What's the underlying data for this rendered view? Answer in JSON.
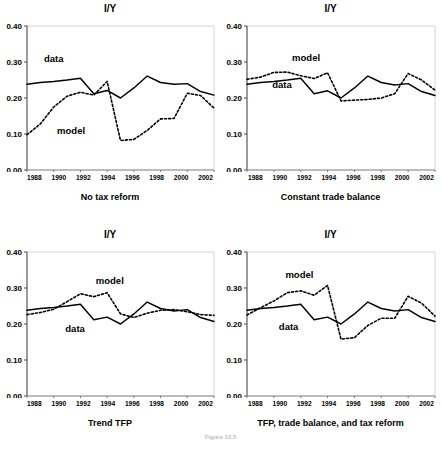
{
  "figure": {
    "caption": "Figure 12.5",
    "panel_count": 4
  },
  "chart_data": [
    {
      "id": "no-tax-reform",
      "type": "line",
      "title": "I/Y",
      "xlabel": "No tax reform",
      "ylabel": "",
      "ylim": [
        0.0,
        0.4
      ],
      "xlim": [
        1988,
        2002
      ],
      "yticks": [
        "0.00",
        "0.10",
        "0.20",
        "0.30",
        "0.40"
      ],
      "ytick_values": [
        0.0,
        0.1,
        0.2,
        0.3,
        0.4
      ],
      "xticks": [
        "1988",
        "1990",
        "1992",
        "1994",
        "1996",
        "1998",
        "2000",
        "2002"
      ],
      "xtick_values": [
        1988,
        1990,
        1992,
        1994,
        1996,
        1998,
        2000,
        2002
      ],
      "grid": false,
      "legend": "inline-annotation",
      "annotations": [
        {
          "text": "data",
          "x": 1990.0,
          "y": 0.3
        },
        {
          "text": "model",
          "x": 1991.3,
          "y": 0.1
        }
      ],
      "x": [
        1988,
        1989,
        1990,
        1991,
        1992,
        1993,
        1994,
        1995,
        1996,
        1997,
        1998,
        1999,
        2000,
        2001,
        2002
      ],
      "series": [
        {
          "name": "data",
          "style": "solid",
          "values": [
            0.238,
            0.243,
            0.246,
            0.25,
            0.255,
            0.212,
            0.221,
            0.2,
            0.228,
            0.261,
            0.243,
            0.238,
            0.24,
            0.218,
            0.208
          ]
        },
        {
          "name": "model",
          "style": "dashed",
          "values": [
            0.098,
            0.128,
            0.175,
            0.205,
            0.216,
            0.208,
            0.246,
            0.082,
            0.085,
            0.11,
            0.142,
            0.143,
            0.213,
            0.207,
            0.172
          ]
        }
      ]
    },
    {
      "id": "constant-trade-balance",
      "type": "line",
      "title": "I/Y",
      "xlabel": "Constant trade balance",
      "ylabel": "",
      "ylim": [
        0.0,
        0.4
      ],
      "xlim": [
        1988,
        2002
      ],
      "yticks": [
        "0.00",
        "0.10",
        "0.20",
        "0.30",
        "0.40"
      ],
      "ytick_values": [
        0.0,
        0.1,
        0.2,
        0.3,
        0.4
      ],
      "xticks": [
        "1988",
        "1990",
        "1992",
        "1994",
        "1996",
        "1998",
        "2000",
        "2002"
      ],
      "xtick_values": [
        1988,
        1990,
        1992,
        1994,
        1996,
        1998,
        2000,
        2002
      ],
      "grid": false,
      "legend": "inline-annotation",
      "annotations": [
        {
          "text": "model",
          "x": 1992.4,
          "y": 0.303
        },
        {
          "text": "data",
          "x": 1990.6,
          "y": 0.228
        }
      ],
      "x": [
        1988,
        1989,
        1990,
        1991,
        1992,
        1993,
        1994,
        1995,
        1996,
        1997,
        1998,
        1999,
        2000,
        2001,
        2002
      ],
      "series": [
        {
          "name": "data",
          "style": "solid",
          "values": [
            0.238,
            0.243,
            0.246,
            0.25,
            0.255,
            0.212,
            0.22,
            0.2,
            0.228,
            0.261,
            0.243,
            0.236,
            0.24,
            0.218,
            0.207
          ]
        },
        {
          "name": "model",
          "style": "dashed",
          "values": [
            0.252,
            0.258,
            0.271,
            0.272,
            0.262,
            0.254,
            0.27,
            0.192,
            0.194,
            0.196,
            0.2,
            0.212,
            0.268,
            0.25,
            0.222
          ]
        }
      ]
    },
    {
      "id": "trend-tfp",
      "type": "line",
      "title": "I/Y",
      "xlabel": "Trend TFP",
      "ylabel": "",
      "ylim": [
        0.0,
        0.4
      ],
      "xlim": [
        1988,
        2002
      ],
      "yticks": [
        "0.00",
        "0.10",
        "0.20",
        "0.30",
        "0.40"
      ],
      "ytick_values": [
        0.0,
        0.1,
        0.2,
        0.3,
        0.4
      ],
      "xticks": [
        "1988",
        "1990",
        "1992",
        "1994",
        "1996",
        "1998",
        "2000",
        "2002"
      ],
      "xtick_values": [
        1988,
        1990,
        1992,
        1994,
        1996,
        1998,
        2000,
        2002
      ],
      "grid": false,
      "legend": "inline-annotation",
      "annotations": [
        {
          "text": "model",
          "x": 1994.2,
          "y": 0.31
        },
        {
          "text": "data",
          "x": 1991.6,
          "y": 0.178
        }
      ],
      "x": [
        1988,
        1989,
        1990,
        1991,
        1992,
        1993,
        1994,
        1995,
        1996,
        1997,
        1998,
        1999,
        2000,
        2001,
        2002
      ],
      "series": [
        {
          "name": "data",
          "style": "solid",
          "values": [
            0.238,
            0.243,
            0.246,
            0.25,
            0.255,
            0.212,
            0.219,
            0.2,
            0.228,
            0.261,
            0.243,
            0.236,
            0.24,
            0.218,
            0.207
          ]
        },
        {
          "name": "model",
          "style": "dashed",
          "values": [
            0.226,
            0.232,
            0.241,
            0.262,
            0.284,
            0.276,
            0.287,
            0.228,
            0.218,
            0.23,
            0.238,
            0.24,
            0.234,
            0.226,
            0.224
          ]
        }
      ]
    },
    {
      "id": "tfp-trade-balance-tax-reform",
      "type": "line",
      "title": "I/Y",
      "xlabel": "TFP, trade balance, and tax reform",
      "ylabel": "",
      "ylim": [
        0.0,
        0.4
      ],
      "xlim": [
        1988,
        2002
      ],
      "yticks": [
        "0.00",
        "0.10",
        "0.20",
        "0.30",
        "0.40"
      ],
      "ytick_values": [
        0.0,
        0.1,
        0.2,
        0.3,
        0.4
      ],
      "xticks": [
        "1988",
        "1990",
        "1992",
        "1994",
        "1996",
        "1998",
        "2000",
        "2002"
      ],
      "xtick_values": [
        1988,
        1990,
        1992,
        1994,
        1996,
        1998,
        2000,
        2002
      ],
      "grid": false,
      "legend": "inline-annotation",
      "annotations": [
        {
          "text": "model",
          "x": 1991.9,
          "y": 0.327
        },
        {
          "text": "data",
          "x": 1991.1,
          "y": 0.182
        }
      ],
      "x": [
        1988,
        1989,
        1990,
        1991,
        1992,
        1993,
        1994,
        1995,
        1996,
        1997,
        1998,
        1999,
        2000,
        2001,
        2002
      ],
      "series": [
        {
          "name": "data",
          "style": "solid",
          "values": [
            0.238,
            0.243,
            0.246,
            0.25,
            0.255,
            0.212,
            0.219,
            0.2,
            0.228,
            0.261,
            0.243,
            0.236,
            0.24,
            0.218,
            0.207
          ]
        },
        {
          "name": "model",
          "style": "dashed",
          "values": [
            0.225,
            0.245,
            0.264,
            0.287,
            0.292,
            0.28,
            0.307,
            0.158,
            0.162,
            0.196,
            0.216,
            0.216,
            0.277,
            0.258,
            0.222
          ]
        }
      ]
    }
  ]
}
